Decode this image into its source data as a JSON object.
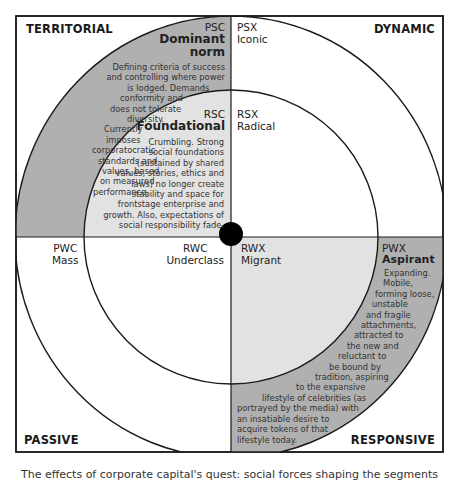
{
  "diagram": {
    "colors": {
      "dark_ring": "#b0b0b0",
      "light_inner": "#e2e2e2",
      "background": "#ffffff",
      "line": "#1a1a1a",
      "center_dot": "#000000"
    },
    "corners": {
      "top_left": "TERRITORIAL",
      "top_right": "DYNAMIC",
      "bottom_left": "PASSIVE",
      "bottom_right": "RESPONSIVE"
    },
    "segments": {
      "psc": {
        "code": "PSC",
        "name_line1": "Dominant",
        "name_line2": "norm",
        "description": [
          "Defining criteria of success",
          "and controlling where power",
          "is lodged. Demands",
          "conformity and",
          "does not tolerate",
          "diversity.",
          "Currently",
          "imposes",
          "corporatocratic",
          "standards and",
          "values, based",
          "on measured",
          "performance."
        ]
      },
      "psx": {
        "code": "PSX",
        "name": "Iconic"
      },
      "rsc": {
        "code": "RSC",
        "name": "Foundational",
        "description": [
          "Crumbling. Strong",
          "social foundations",
          "(sustained by shared",
          "values, stories, ethics and",
          "laws) no longer create",
          "stability and space for",
          "frontstage enterprise and",
          "growth. Also, expectations of",
          "social responsibility fade."
        ]
      },
      "rsx": {
        "code": "RSX",
        "name": "Radical"
      },
      "pwc": {
        "code": "PWC",
        "name": "Mass"
      },
      "rwc": {
        "code": "RWC",
        "name": "Underclass"
      },
      "rwx": {
        "code": "RWX",
        "name": "Migrant"
      },
      "pwx": {
        "code": "PWX",
        "name": "Aspirant",
        "description": [
          "Expanding.",
          "Mobile,",
          "forming loose,",
          "unstable",
          "and fragile",
          "attachments,",
          "attracted to",
          "the new and",
          "reluctant to",
          "be bound by",
          "tradition, aspiring",
          "to the expansive",
          "lifestyle of celebrities (as",
          "portrayed by the media) with",
          "an insatiable desire to",
          "acquire tokens of that",
          "lifestyle today."
        ]
      }
    },
    "caption": "The effects of corporate capital's quest: social forces shaping the segments"
  }
}
